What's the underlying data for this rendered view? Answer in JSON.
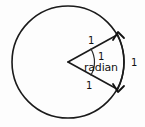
{
  "figure": {
    "background_color": "#fdfdfd",
    "stroke_color": "#1a1a1a"
  },
  "labels": {
    "radius_upper": "1",
    "radius_lower": "1",
    "angle_value": "1",
    "angle_unit": "radian",
    "arc_length": "1"
  },
  "geometry": {
    "circle": {
      "cx": 68,
      "cy": 62,
      "r": 56
    },
    "sector": {
      "vertex": {
        "x": 68,
        "y": 62
      },
      "upper_endpoint": {
        "x": 117,
        "y": 35
      },
      "lower_endpoint": {
        "x": 117,
        "y": 89
      },
      "angle_arc_radius": 26
    },
    "arc_arrow": {
      "start": {
        "x": 124,
        "y": 31
      },
      "end": {
        "x": 124,
        "y": 93
      },
      "double_headed": true
    }
  },
  "icons": {
    "arrow_up": "arrow-head-up-icon",
    "arrow_down": "arrow-head-down-icon"
  }
}
